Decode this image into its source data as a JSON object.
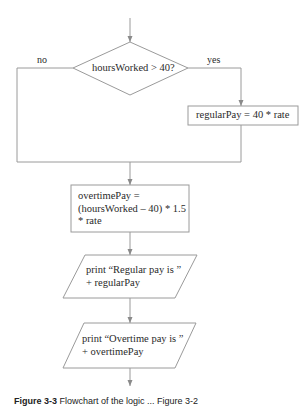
{
  "diagram": {
    "type": "flowchart",
    "decision": {
      "text": "hoursWorked > 40?",
      "no_label": "no",
      "yes_label": "yes"
    },
    "yes_branch": {
      "process": "regularPay = 40 * rate"
    },
    "merged_steps": {
      "overtime_process": {
        "lines": [
          "overtimePay =",
          "(hoursWorked – 40) * 1.5",
          "* rate"
        ]
      },
      "output_regular": {
        "lines": [
          "print “Regular pay is ”",
          "+ regularPay"
        ]
      },
      "output_overtime": {
        "lines": [
          "print “Overtime pay is ”",
          "+ overtimePay"
        ]
      }
    },
    "colors": {
      "line": "#9a9a9a",
      "text": "#2a2a2a",
      "background": "#ffffff"
    }
  },
  "caption": {
    "label": "Figure 3-3",
    "text": "Flowchart of the logic ... Figure 3-2"
  }
}
